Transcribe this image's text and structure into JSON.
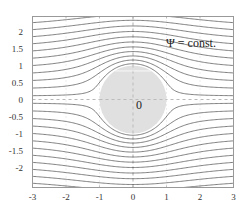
{
  "chart_data": {
    "type": "line",
    "title": "",
    "xlabel": "",
    "ylabel": "",
    "xlim": [
      -3,
      3
    ],
    "ylim": [
      -2.5,
      2.5
    ],
    "x_ticks": [
      -3,
      -2,
      -1,
      0,
      1,
      2,
      3
    ],
    "x_tick_labels": [
      "-3",
      "-2",
      "-1",
      "0",
      "1",
      "2",
      "3"
    ],
    "y_ticks": [
      -2,
      -1.5,
      -1,
      -0.5,
      0,
      0.5,
      1,
      1.5,
      2
    ],
    "y_tick_labels": [
      "-2",
      "-1.5",
      "-1",
      "-0.5",
      "0",
      "0.5",
      "1",
      "1.5",
      "2"
    ],
    "grid": true,
    "grid_style": "dashed light gray",
    "axes_dashed": {
      "x0": true,
      "y0": true
    },
    "cylinder": {
      "center": [
        0,
        0
      ],
      "radius": 1,
      "fill": "#e0e0e0",
      "label": "0"
    },
    "streamfunction": "psi = y * (1 - 1/(x^2 + y^2))",
    "psi_levels": [
      0.1,
      0.3,
      0.5,
      0.7,
      0.9,
      1.1,
      1.3,
      1.5,
      1.7,
      1.9,
      2.1,
      2.3,
      -0.1,
      -0.3,
      -0.5,
      -0.7,
      -0.9,
      -1.1,
      -1.3,
      -1.5,
      -1.7,
      -1.9,
      -2.1,
      -2.3
    ],
    "annotation": {
      "text": "Ψ = const.",
      "x": 1.65,
      "y": 1.7
    }
  },
  "colors": {
    "streamline": "#555555",
    "frame": "#999999",
    "grid": "#bbbbbb",
    "cylinder_fill": "#e0e0e0",
    "text": "#333333"
  },
  "labels": {
    "annotation": "Ψ = const.",
    "cylinder_label": "0"
  }
}
